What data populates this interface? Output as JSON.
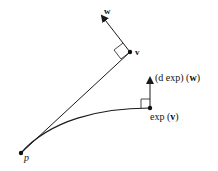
{
  "diagram": {
    "type": "geometry-exponential-map",
    "colors": {
      "stroke": "#1a1a1a",
      "background": "#ffffff"
    },
    "points": {
      "p": {
        "label": "p",
        "x": 21,
        "y": 153
      },
      "v": {
        "label": "v",
        "x": 130,
        "y": 52
      },
      "exp_v": {
        "label": "exp (v)",
        "x": 150,
        "y": 108
      }
    },
    "vectors": {
      "w": {
        "label": "w",
        "from": [
          130,
          52
        ],
        "to": [
          100,
          13
        ]
      },
      "dexp_w": {
        "label": "(d exp) (w)",
        "from": [
          150,
          108
        ],
        "to": [
          150,
          75
        ]
      }
    },
    "labels": {
      "w": "w",
      "v": "v",
      "dexp_prefix": "(d exp) (",
      "dexp_w": "w",
      "dexp_suffix": ")",
      "exp_prefix": "exp (",
      "exp_v": "v",
      "exp_suffix": ")",
      "p": "p"
    }
  }
}
